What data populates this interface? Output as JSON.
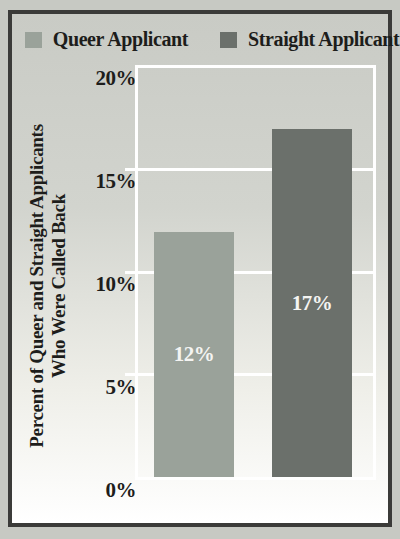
{
  "colors": {
    "queer_bar": "#9aa29a",
    "straight_bar": "#6b706b",
    "frame_border": "#3b3b39",
    "background": "#d2d4ce",
    "gridline": "#ffffff",
    "text": "#1d1d1b",
    "bar_label_text": "#f4f4f2"
  },
  "legend": {
    "items": [
      {
        "label": "Queer Applicant",
        "color": "#9aa29a"
      },
      {
        "label": "Straight Applicant",
        "color": "#6b706b"
      }
    ]
  },
  "y_axis": {
    "title_line1": "Percent of Queer and Straight Applicants",
    "title_line2": "Who Were Called Back",
    "ticks": [
      "20%",
      "15%",
      "10%",
      "5%",
      "0%"
    ]
  },
  "bars": [
    {
      "name": "Queer Applicant",
      "label": "12%",
      "value": 12
    },
    {
      "name": "Straight Applicant",
      "label": "17%",
      "value": 17
    }
  ],
  "chart_data": {
    "type": "bar",
    "categories": [
      "Queer Applicant",
      "Straight Applicant"
    ],
    "values": [
      12,
      17
    ],
    "series_colors": [
      "#9aa29a",
      "#6b706b"
    ],
    "data_labels": [
      "12%",
      "17%"
    ],
    "title": "",
    "xlabel": "",
    "ylabel": "Percent of Queer and Straight Applicants Who Were Called Back",
    "ylim": [
      0,
      20
    ],
    "ytick_labels": [
      "0%",
      "5%",
      "10%",
      "15%",
      "20%"
    ],
    "grid": true,
    "legend_position": "top"
  }
}
